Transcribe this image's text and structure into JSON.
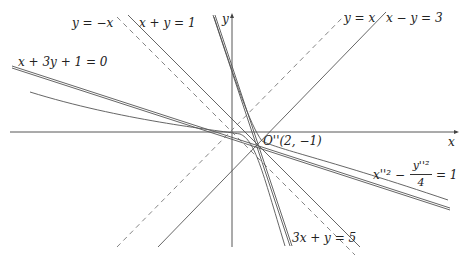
{
  "diagram": {
    "axes": {
      "x_label": "x",
      "y_label": "y"
    },
    "center": {
      "label": "O''(2, −1)"
    },
    "lines": [
      {
        "label": "y = −x",
        "style": "dashed"
      },
      {
        "label": "x + y = 1",
        "style": "solid"
      },
      {
        "label": "x + 3y + 1 = 0",
        "style": "solid"
      },
      {
        "label": "y = x",
        "style": "dashed"
      },
      {
        "label": "x − y = 3",
        "style": "solid"
      },
      {
        "label": "3x + y = 5",
        "style": "solid"
      }
    ],
    "curve": {
      "label_lhs_a": "x''² − ",
      "label_num": "y''²",
      "label_den": "4",
      "label_rhs": "= 1"
    },
    "colors": {
      "line": "#555555",
      "dashed": "#777777",
      "text": "#222222"
    }
  }
}
